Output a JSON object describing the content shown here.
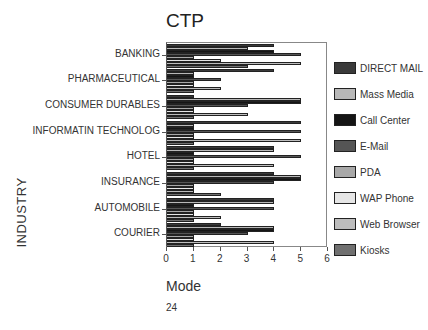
{
  "chart_data": {
    "type": "bar",
    "orientation": "horizontal",
    "title": "CTP",
    "xlabel": "Mode",
    "ylabel": "INDUSTRY",
    "xlim": [
      0,
      6
    ],
    "xticks": [
      "0",
      "1",
      "2",
      "3",
      "4",
      "5",
      "6"
    ],
    "grid": false,
    "legend_position": "right",
    "categories": [
      "BANKING",
      "PHARMACEUTICAL",
      "CONSUMER DURABLES",
      "INFORMATIN TECHNOLOG",
      "HOTEL",
      "INSURANCE",
      "AUTOMOBILE",
      "COURIER"
    ],
    "series": [
      {
        "name": "DIRECT MAIL",
        "color": "#3a3a3a",
        "values": [
          4,
          4,
          1,
          5,
          4,
          4,
          4,
          2
        ]
      },
      {
        "name": "Mass Media",
        "color": "#b8b8b8",
        "values": [
          3,
          1,
          5,
          1,
          4,
          5,
          4,
          4
        ]
      },
      {
        "name": "Call Center",
        "color": "#151515",
        "values": [
          4,
          1,
          5,
          1,
          1,
          5,
          1,
          4
        ]
      },
      {
        "name": "E-Mail",
        "color": "#555555",
        "values": [
          5,
          2,
          3,
          5,
          5,
          4,
          4,
          3
        ]
      },
      {
        "name": "PDA",
        "color": "#a8a8a8",
        "values": [
          1,
          1,
          1,
          1,
          1,
          1,
          1,
          1
        ]
      },
      {
        "name": "WAP Phone",
        "color": "#e6e6e6",
        "values": [
          2,
          1,
          1,
          1,
          1,
          1,
          1,
          1
        ]
      },
      {
        "name": "Web Browser",
        "color": "#bdbdbd",
        "values": [
          5,
          2,
          3,
          5,
          4,
          1,
          2,
          4
        ]
      },
      {
        "name": "Kiosks",
        "color": "#707070",
        "values": [
          3,
          1,
          1,
          1,
          1,
          2,
          1,
          1
        ]
      }
    ]
  },
  "page": {
    "number": "24"
  }
}
